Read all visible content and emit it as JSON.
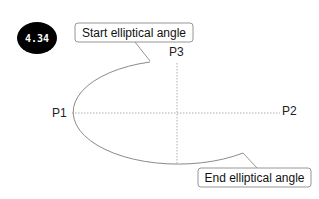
{
  "figure": {
    "badge": {
      "label": "4.34",
      "fill": "#000000",
      "text_color": "#ffffff"
    },
    "callouts": {
      "start": {
        "label": "Start elliptical angle"
      },
      "end": {
        "label": "End elliptical angle"
      }
    },
    "points": {
      "p1": "P1",
      "p2": "P2",
      "p3": "P3"
    },
    "colors": {
      "arc": "#8a8a8a",
      "axis": "#9a9a9a",
      "callout_border": "#8a8a8a"
    }
  }
}
